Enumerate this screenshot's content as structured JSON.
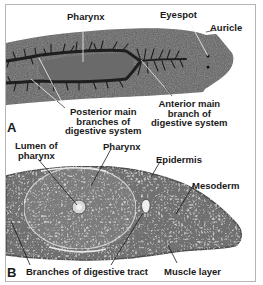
{
  "figure": {
    "panel_a": {
      "letter": "A",
      "labels": {
        "pharynx": "Pharynx",
        "eyespot": "Eyespot",
        "auricle": "Auricle",
        "posterior_1": "Posterior main",
        "posterior_2": "branches of",
        "posterior_3": "digestive system",
        "anterior_1": "Anterior main",
        "anterior_2": "branch of",
        "anterior_3": "digestive system"
      }
    },
    "panel_b": {
      "letter": "B",
      "labels": {
        "lumen_1": "Lumen of",
        "lumen_2": "pharynx",
        "pharynx": "Pharynx",
        "epidermis": "Epidermis",
        "mesoderm": "Mesoderm",
        "branches": "Branches of digestive tract",
        "muscle": "Muscle layer"
      }
    },
    "colors": {
      "border": "#b5b5b5",
      "body_a": "#5e5e5e",
      "gut_a": "#1e1e1e",
      "tissue_b": "#6f6f6f",
      "tissue_b_light": "#a8a8a8"
    }
  }
}
